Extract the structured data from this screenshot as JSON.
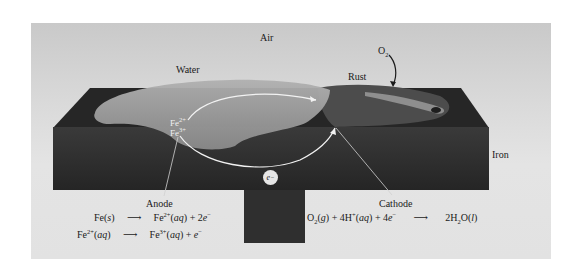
{
  "labels": {
    "air": "Air",
    "water": "Water",
    "rust": "Rust",
    "o2": "O",
    "o2_sub": "2",
    "iron": "Iron",
    "anode": "Anode",
    "cathode": "Cathode",
    "electron": "e",
    "electron_sup": "−",
    "ion_fe2": "Fe",
    "ion_fe2_sup": "2+",
    "ion_fe3": "Fe",
    "ion_fe3_sup": "3+"
  },
  "equations": {
    "anode_1": {
      "reactant": "Fe(",
      "reactant_state": "s",
      "reactant_close": ")",
      "arrow": "⟶",
      "product": "Fe",
      "product_sup": "2+",
      "product_state": "aq",
      "plus": " + 2",
      "electron": "e",
      "electron_sup": "−"
    },
    "anode_2": {
      "reactant": "Fe",
      "reactant_sup": "2+",
      "reactant_state": "aq",
      "arrow": "⟶",
      "product": "Fe",
      "product_sup": "3+",
      "product_state": "aq",
      "plus": " + ",
      "electron": "e",
      "electron_sup": "−"
    },
    "cathode": {
      "o2": "O",
      "o2_sub": "2",
      "o2_state": "g",
      "h": " + 4H",
      "h_sup": "+",
      "h_state": "aq",
      "e_coef": " + 4",
      "electron": "e",
      "electron_sup": "−",
      "arrow": "⟶",
      "product": "2H",
      "product_sub": "2",
      "product_o": "O(",
      "product_state": "l",
      "product_close": ")"
    }
  },
  "colors": {
    "background_panel": "#d6d6d6",
    "iron_block": "#2e2e2e",
    "water_drop": "#9a9a9a",
    "rust": "#4a4a4a",
    "arrows": "#f2f2f2"
  }
}
